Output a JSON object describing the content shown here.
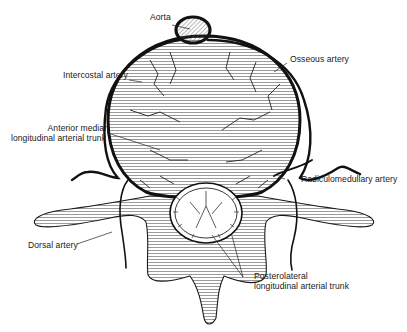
{
  "diagram": {
    "labels": {
      "aorta": "Aorta",
      "osseous_artery": "Osseous artery",
      "intercostal_artery": "Intercostal artery",
      "anterior_median_line1": "Anterior median",
      "anterior_median_line2": "longitudinal arterial trunk",
      "radiculomedullary_artery": "Radiculomedullary artery",
      "dorsal_artery": "Dorsal artery",
      "posterolateral_line1": "Posterolateral",
      "posterolateral_line2": "longitudinal arterial trunk"
    },
    "colors": {
      "ink": "#1a1a1a",
      "background": "#ffffff",
      "hatch": "#4a4a4a"
    }
  }
}
